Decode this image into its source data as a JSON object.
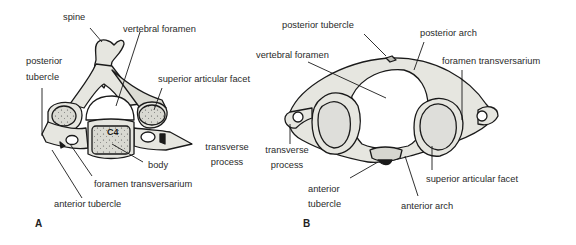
{
  "figure": {
    "panels": [
      {
        "id": "A",
        "letter": "A",
        "vertebra_marker": "C4",
        "labels": {
          "spine": "spine",
          "vertebral_foramen": "vertebral foramen",
          "posterior_tubercle_1": "posterior",
          "posterior_tubercle_2": "tubercle",
          "superior_articular_facet": "superior articular facet",
          "transverse_process_1": "transverse",
          "transverse_process_2": "process",
          "body": "body",
          "foramen_transversarium": "foramen transversarium",
          "anterior_tubercle": "anterior tubercle"
        }
      },
      {
        "id": "B",
        "letter": "B",
        "labels": {
          "posterior_tubercle": "posterior tubercle",
          "posterior_arch": "posterior arch",
          "vertebral_foramen": "vertebral foramen",
          "foramen_transversarium": "foramen transversarium",
          "transverse_process_1": "transverse",
          "transverse_process_2": "process",
          "anterior_tubercle_1": "anterior",
          "anterior_tubercle_2": "tubercle",
          "superior_articular_facet": "superior articular facet",
          "anterior_arch": "anterior arch"
        }
      }
    ],
    "colors": {
      "bone_fill": "#e6e6e0",
      "outline": "#1a1a1a",
      "background": "#ffffff"
    }
  }
}
